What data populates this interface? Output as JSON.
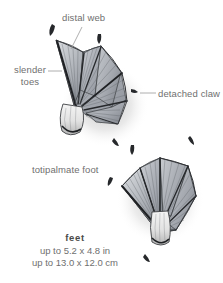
{
  "illustration": {
    "subject": "totipalmate-webbed-foot-pencil-drawing",
    "background_color": "#ffffff",
    "ink_color": "#2b2b2b",
    "web_fill_color": "#b9bcc2",
    "shadow_color": "#9a9a9a",
    "specimen_count": 2
  },
  "labels": {
    "distal_web": "distal web",
    "slender_toes": "slender\ntoes",
    "slender_toes_line1": "slender",
    "slender_toes_line2": "toes",
    "detached_claw": "detached claw",
    "totipalmate_foot": "totipalmate foot",
    "text_color": "#6f6f6f"
  },
  "caption": {
    "title": "feet",
    "size_imperial": "up to 5.2 x 4.8 in",
    "size_metric": "up to 13.0 x 12.0 cm",
    "title_color": "#4a4a4a"
  }
}
